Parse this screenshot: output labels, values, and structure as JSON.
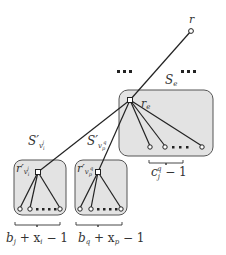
{
  "labels": {
    "root": "r",
    "re": "r",
    "re_sub": "e",
    "Se": "S",
    "Se_sub": "e",
    "S_vi": "S′",
    "S_vi_sub": "v",
    "S_vi_subsub": "i",
    "S_vi_sup": "j",
    "S_vp": "S′",
    "S_vp_sub": "v",
    "S_vp_subsub": "p",
    "S_vp_sup": "q",
    "r_vi": "r′",
    "r_vi_sub": "v",
    "r_vi_subsub": "i",
    "r_vi_sup": "j",
    "r_vp": "r′",
    "r_vp_sub": "v",
    "r_vp_subsub": "p",
    "r_vp_sup": "q",
    "brace_se": "c",
    "brace_se_sub": "j",
    "brace_se_sup": "q",
    "brace_se_tail": " − 1",
    "brace_left_1": "b",
    "brace_left_1_sub": "j",
    "brace_left_2": " + x",
    "brace_left_2_sub": "i",
    "brace_left_tail": " − 1",
    "brace_mid_1": "b",
    "brace_mid_1_sub": "q",
    "brace_mid_2": " + x",
    "brace_mid_2_sub": "p",
    "brace_mid_tail": " − 1",
    "ellipsis": "• • •"
  },
  "colors": {
    "box_fill": "#e3e3e3",
    "box_stroke": "#555555",
    "edge": "#222222"
  }
}
